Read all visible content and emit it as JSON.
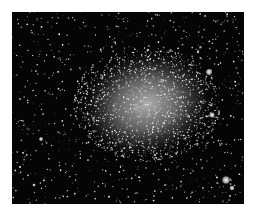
{
  "image": {
    "subject": "irregular dwarf galaxy star field",
    "style": "grayscale astronomical photograph",
    "colors": {
      "background": "#ffffff",
      "sky": "#050505",
      "galaxy_core": "#b8b8b8",
      "stars": "#e8e8e8"
    },
    "galaxy": {
      "cx": 135,
      "cy": 92,
      "rx": 70,
      "ry": 55
    },
    "bright_objects": [
      {
        "x": 197,
        "y": 60,
        "r": 4
      },
      {
        "x": 200,
        "y": 103,
        "r": 3.5
      },
      {
        "x": 214,
        "y": 168,
        "r": 5
      },
      {
        "x": 220,
        "y": 176,
        "r": 3
      },
      {
        "x": 29,
        "y": 127,
        "r": 2.5
      },
      {
        "x": 22,
        "y": 173,
        "r": 2
      },
      {
        "x": 8,
        "y": 155,
        "r": 1.5
      },
      {
        "x": 136,
        "y": 38,
        "r": 1.8
      },
      {
        "x": 186,
        "y": 40,
        "r": 1.8
      },
      {
        "x": 143,
        "y": 143,
        "r": 1.5
      }
    ]
  }
}
